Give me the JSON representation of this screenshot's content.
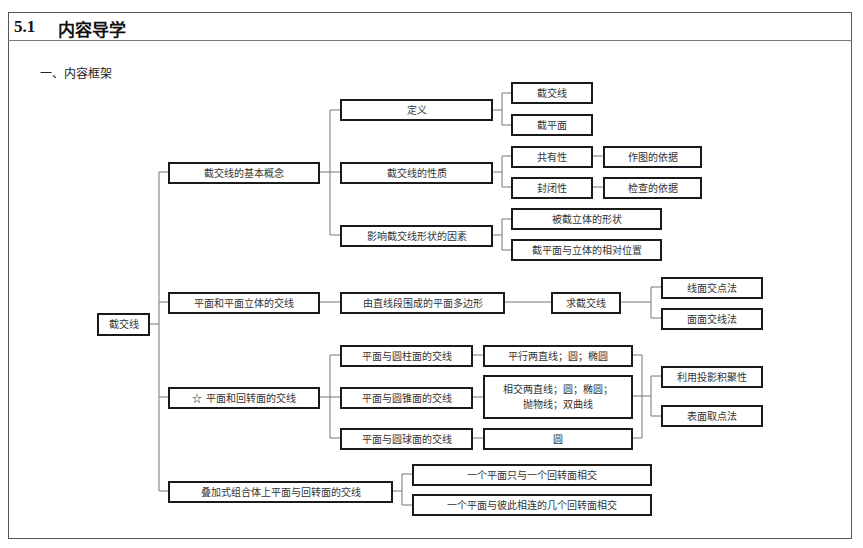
{
  "header": {
    "section_number": "5.1",
    "section_title": "内容导学",
    "subtitle": "一、内容框架"
  },
  "diagram": {
    "root": "截交线",
    "level1": {
      "basic_concept": "截交线的基本概念",
      "polyhedron": "平面和平面立体的交线",
      "revolution": "☆ 平面和回转面的交线",
      "compound": "叠加式组合体上平面与回转面的交线"
    },
    "basic_concept": {
      "definition": "定义",
      "definition_children": [
        "截交线",
        "截平面"
      ],
      "properties": "截交线的性质",
      "property_items": [
        {
          "name": "共有性",
          "note": "作图的依据"
        },
        {
          "name": "封闭性",
          "note": "检查的依据"
        }
      ],
      "factors": "影响截交线形状的因素",
      "factor_children": [
        "被截立体的形状",
        "截平面与立体的相对位置"
      ]
    },
    "polyhedron": {
      "shape": "由直线段围成的平面多边形",
      "method": "求截交线",
      "method_children": [
        "线面交点法",
        "面面交线法"
      ]
    },
    "revolution": {
      "cases": [
        {
          "name": "平面与圆柱面的交线",
          "result": "平行两直线；圆；椭圆"
        },
        {
          "name": "平面与圆锥面的交线",
          "result": "相交两直线；圆；椭圆；\n抛物线；双曲线"
        },
        {
          "name": "平面与圆球面的交线",
          "result": "圆"
        }
      ],
      "methods": [
        "利用投影积聚性",
        "表面取点法"
      ]
    },
    "compound": {
      "children": [
        "一个平面只与一个回转面相交",
        "一个平面与彼此相连的几个回转面相交"
      ]
    }
  }
}
